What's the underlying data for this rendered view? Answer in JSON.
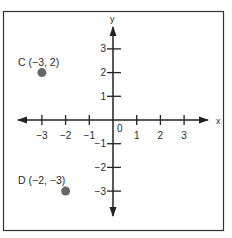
{
  "figure": {
    "type": "coordinate-plane",
    "frame": {
      "x": 3,
      "y": 11,
      "width": 221,
      "height": 220,
      "stroke": "#333333"
    },
    "origin_px": {
      "x": 113,
      "y": 120
    },
    "unit_px": 23.7,
    "axes": {
      "x_label": "x",
      "y_label": "y",
      "origin_label": "0",
      "x_range": [
        -3,
        3
      ],
      "y_range": [
        -3,
        3
      ],
      "x_ticks": [
        {
          "value": -3,
          "label": "−3"
        },
        {
          "value": -2,
          "label": "−2"
        },
        {
          "value": -1,
          "label": "−1"
        },
        {
          "value": 1,
          "label": "1"
        },
        {
          "value": 2,
          "label": "2"
        },
        {
          "value": 3,
          "label": "3"
        }
      ],
      "y_ticks": [
        {
          "value": 3,
          "label": "3"
        },
        {
          "value": 2,
          "label": "2"
        },
        {
          "value": 1,
          "label": "1"
        },
        {
          "value": -1,
          "label": "−1"
        },
        {
          "value": -2,
          "label": "−2"
        },
        {
          "value": -3,
          "label": "−3"
        }
      ],
      "color": "#222222"
    },
    "points": [
      {
        "name": "C",
        "x": -3,
        "y": 2,
        "label": "C (−3, 2)",
        "color": "#666666"
      },
      {
        "name": "D",
        "x": -2,
        "y": -3,
        "label": "D (−2, −3)",
        "color": "#666666"
      }
    ]
  }
}
